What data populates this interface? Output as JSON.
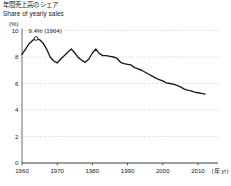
{
  "title": {
    "japanese": "年間売上高のシェア",
    "english": "Share of yearly sales"
  },
  "axis_unit_label": "(%)",
  "xaxis_unit_label": "(年 yr)",
  "annotation": {
    "text": "9.4% (1964)",
    "year": 1964,
    "value": 9.4
  },
  "chart_data": {
    "type": "line",
    "xlabel": "(年 yr)",
    "ylabel": "(%)",
    "xlim": [
      1960,
      2012
    ],
    "ylim": [
      0,
      10
    ],
    "yticks": [
      0,
      2,
      4,
      6,
      8,
      10
    ],
    "ytick_labels": [
      "0",
      "2",
      "4",
      "6",
      "8",
      "10"
    ],
    "xticks": [
      1960,
      1970,
      1980,
      1990,
      2000,
      2010
    ],
    "xtick_labels": [
      "1960",
      "1970",
      "1980",
      "1990",
      "2000",
      "2010"
    ],
    "grid": true,
    "grid_style": "dotted-horizontal",
    "legend": false,
    "line_color": "#1a1a1a",
    "x": [
      1960,
      1961,
      1962,
      1963,
      1964,
      1965,
      1966,
      1967,
      1968,
      1969,
      1970,
      1971,
      1972,
      1973,
      1974,
      1975,
      1976,
      1977,
      1978,
      1979,
      1980,
      1981,
      1982,
      1983,
      1984,
      1985,
      1986,
      1987,
      1988,
      1989,
      1990,
      1991,
      1992,
      1993,
      1994,
      1995,
      1996,
      1997,
      1998,
      1999,
      2000,
      2001,
      2002,
      2003,
      2004,
      2005,
      2006,
      2007,
      2008,
      2009,
      2010,
      2011,
      2012
    ],
    "values": [
      8.2,
      8.6,
      9.0,
      9.25,
      9.4,
      9.3,
      9.05,
      8.6,
      8.0,
      7.7,
      7.55,
      7.85,
      8.1,
      8.35,
      8.6,
      8.3,
      7.95,
      7.75,
      7.6,
      7.85,
      8.3,
      8.6,
      8.25,
      8.1,
      8.1,
      8.05,
      8.0,
      7.9,
      7.6,
      7.5,
      7.45,
      7.4,
      7.2,
      7.1,
      7.0,
      6.85,
      6.7,
      6.55,
      6.4,
      6.3,
      6.2,
      6.05,
      6.0,
      5.95,
      5.85,
      5.75,
      5.6,
      5.5,
      5.45,
      5.35,
      5.3,
      5.25,
      5.2
    ]
  }
}
